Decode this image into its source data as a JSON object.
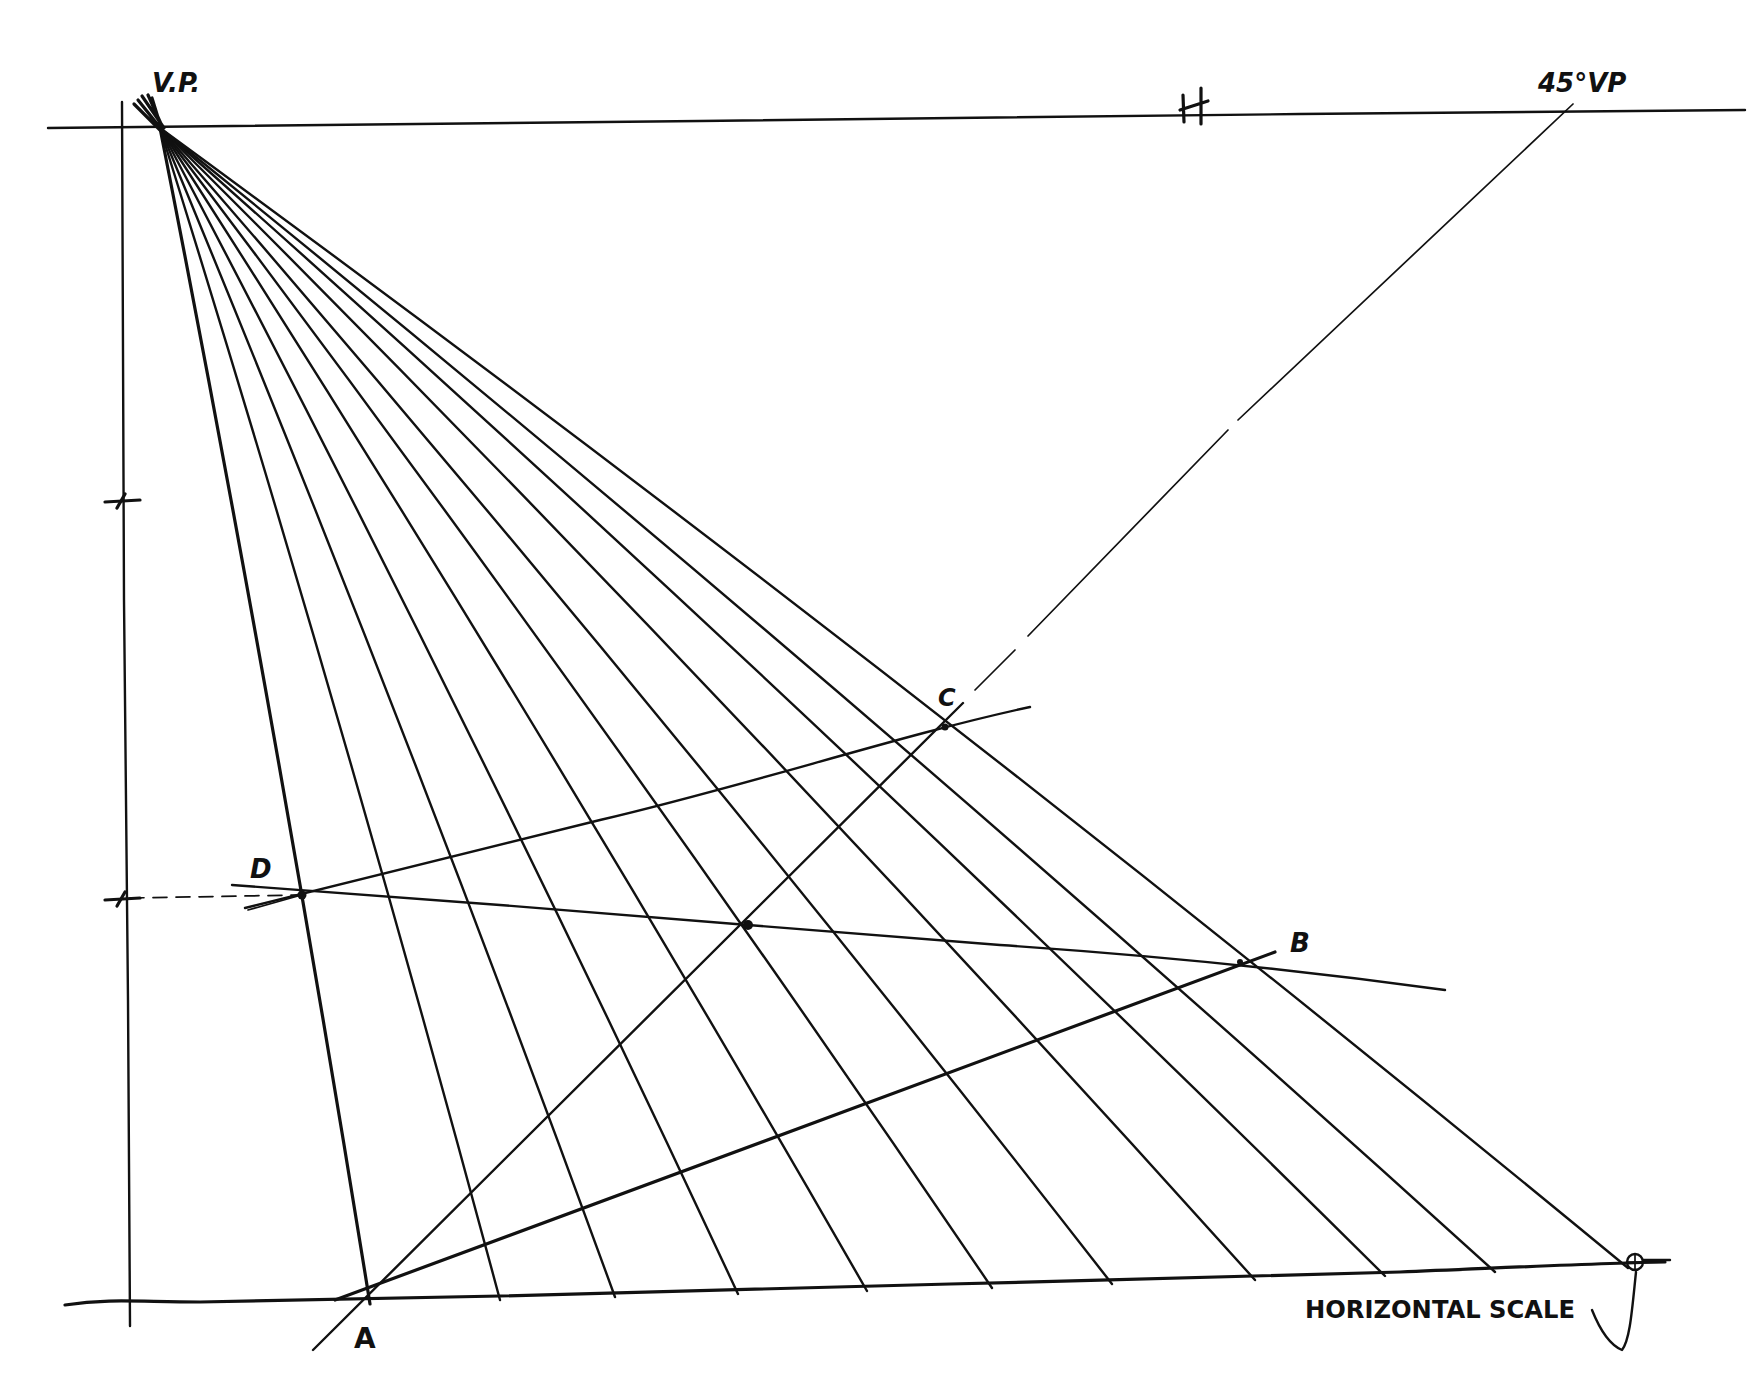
{
  "diagram": {
    "ink_color": "#111111",
    "background": "#ffffff",
    "labels": {
      "vp": "V.P.",
      "horizon": "H.",
      "vp45": "45°VP",
      "a": "A",
      "b": "B",
      "c": "C",
      "d": "D",
      "horizontal_scale": "HORIZONTAL SCALE"
    },
    "points": {
      "vp": [
        160,
        128
      ],
      "vp45": [
        1570,
        108
      ],
      "a": [
        370,
        1298
      ],
      "b": [
        1240,
        962
      ],
      "c": [
        945,
        727
      ],
      "d": [
        302,
        895
      ],
      "center": [
        748,
        925
      ],
      "scale_end": [
        1628,
        1262
      ]
    },
    "horizon_line": {
      "from": [
        48,
        128
      ],
      "to": [
        1745,
        110
      ]
    },
    "ground_line": {
      "from": [
        65,
        1302
      ],
      "to": [
        1665,
        1260
      ]
    },
    "vertical_measure_line": {
      "from": [
        122,
        102
      ],
      "to": [
        130,
        1326
      ],
      "ticks_y": [
        500,
        898
      ]
    },
    "radiating_line_ends_x": [
      370,
      500,
      615,
      738,
      867,
      992,
      1112,
      1255,
      1385,
      1495,
      1628
    ],
    "radiating_line_ends_y": [
      1298,
      1294,
      1291,
      1288,
      1285,
      1282,
      1278,
      1274,
      1270,
      1266,
      1262
    ]
  }
}
